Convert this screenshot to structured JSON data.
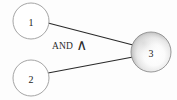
{
  "diagram": {
    "background_color": "#fdfdfd",
    "edge_color": "#2a2a2a",
    "open_node_fill": "#ffffff",
    "open_node_stroke": "#9a9a9a",
    "filled_node_stroke": "#8d8d8d",
    "gradient_light": "#ffffff",
    "gradient_mid": "#e8e8e8",
    "gradient_dark": "#9e9e9e"
  },
  "nodes": [
    {
      "id": "node-1",
      "label": "1",
      "cx": 31,
      "cy": 21,
      "r": 18,
      "style": "open"
    },
    {
      "id": "node-2",
      "label": "2",
      "cx": 31,
      "cy": 78,
      "r": 18,
      "style": "open"
    },
    {
      "id": "node-3",
      "label": "3",
      "cx": 151,
      "cy": 52,
      "r": 20,
      "style": "gradient"
    }
  ],
  "edges": [
    {
      "id": "edge-1-3",
      "from": "1",
      "to": "3",
      "x1": 48,
      "y1": 23,
      "x2": 132,
      "y2": 45
    },
    {
      "id": "edge-2-3",
      "from": "2",
      "to": "3",
      "x1": 48,
      "y1": 73,
      "x2": 132,
      "y2": 57
    }
  ],
  "annotation": {
    "text": "AND",
    "symbol": "∧",
    "symbol_name": "logical-and-wedge",
    "left": 52,
    "top": 38
  }
}
